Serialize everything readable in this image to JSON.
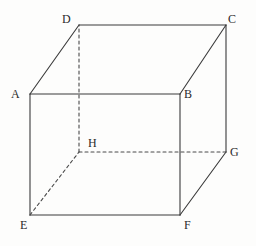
{
  "figure": {
    "name": "labelled-cube-diagram",
    "width": 256,
    "height": 246,
    "background_color": "#fdfdfc",
    "stroke_color": "#3a3a3a",
    "stroke_width": 1.1,
    "hidden_stroke_color": "#4a4a4a",
    "hidden_dash_pattern": "3,3"
  },
  "vertices": [
    {
      "id": "A",
      "label": "A",
      "x": 30,
      "y": 94,
      "label_x": 11,
      "label_y": 88,
      "visible": true
    },
    {
      "id": "B",
      "label": "B",
      "x": 180,
      "y": 94,
      "label_x": 184,
      "label_y": 88,
      "visible": true
    },
    {
      "id": "C",
      "label": "C",
      "x": 226,
      "y": 25,
      "label_x": 228,
      "label_y": 13,
      "visible": true
    },
    {
      "id": "D",
      "label": "D",
      "x": 79,
      "y": 25,
      "label_x": 62,
      "label_y": 13,
      "visible": true
    },
    {
      "id": "E",
      "label": "E",
      "x": 30,
      "y": 215,
      "label_x": 20,
      "label_y": 219,
      "visible": true
    },
    {
      "id": "F",
      "label": "F",
      "x": 180,
      "y": 215,
      "label_x": 184,
      "label_y": 219,
      "visible": true
    },
    {
      "id": "G",
      "label": "G",
      "x": 226,
      "y": 152,
      "label_x": 230,
      "label_y": 146,
      "visible": true
    },
    {
      "id": "H",
      "label": "H",
      "x": 79,
      "y": 152,
      "label_x": 88,
      "label_y": 137,
      "visible": false
    }
  ],
  "edges": [
    {
      "id": "edge-AB",
      "from": "A",
      "to": "B",
      "style": "solid",
      "face": "front"
    },
    {
      "id": "edge-BF",
      "from": "B",
      "to": "F",
      "style": "solid",
      "face": "front"
    },
    {
      "id": "edge-FE",
      "from": "F",
      "to": "E",
      "style": "solid",
      "face": "front"
    },
    {
      "id": "edge-EA",
      "from": "E",
      "to": "A",
      "style": "solid",
      "face": "front"
    },
    {
      "id": "edge-DC",
      "from": "D",
      "to": "C",
      "style": "solid",
      "face": "back"
    },
    {
      "id": "edge-CG",
      "from": "C",
      "to": "G",
      "style": "solid",
      "face": "back"
    },
    {
      "id": "edge-GH",
      "from": "G",
      "to": "H",
      "style": "dashed",
      "face": "back"
    },
    {
      "id": "edge-HD",
      "from": "H",
      "to": "D",
      "style": "dashed",
      "face": "back"
    },
    {
      "id": "edge-AD",
      "from": "A",
      "to": "D",
      "style": "solid",
      "face": "left"
    },
    {
      "id": "edge-BC",
      "from": "B",
      "to": "C",
      "style": "solid",
      "face": "right"
    },
    {
      "id": "edge-FG",
      "from": "F",
      "to": "G",
      "style": "solid",
      "face": "right"
    },
    {
      "id": "edge-EH",
      "from": "E",
      "to": "H",
      "style": "dashed",
      "face": "bottom"
    }
  ]
}
